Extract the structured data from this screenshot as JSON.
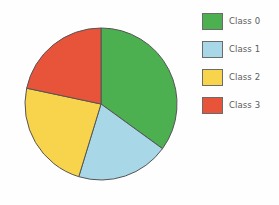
{
  "chart_data": {
    "type": "pie",
    "title": "",
    "labels": [
      "Class 0",
      "Class 1",
      "Class 2",
      "Class 3"
    ],
    "values": [
      35.0,
      19.7,
      23.6,
      21.7
    ],
    "units": "percent",
    "start_angle_deg": 90,
    "direction": "clockwise",
    "slice_angles_deg": [
      126,
      71,
      85,
      78
    ],
    "boundary_angles_from_top_deg": [
      0,
      126,
      197,
      282,
      360
    ],
    "colors": [
      "#4CAF50",
      "#A8D8E8",
      "#F8D44C",
      "#E8543A"
    ],
    "edge_color": "#555555",
    "background": "#FEFEFE",
    "legend": {
      "position": "right",
      "entries": [
        {
          "label": "Class 0",
          "color": "#4CAF50"
        },
        {
          "label": "Class 1",
          "color": "#A8D8E8"
        },
        {
          "label": "Class 2",
          "color": "#F8D44C"
        },
        {
          "label": "Class 3",
          "color": "#E8543A"
        }
      ]
    },
    "geometry": {
      "center_x": 101,
      "center_y": 104,
      "radius": 76
    }
  }
}
